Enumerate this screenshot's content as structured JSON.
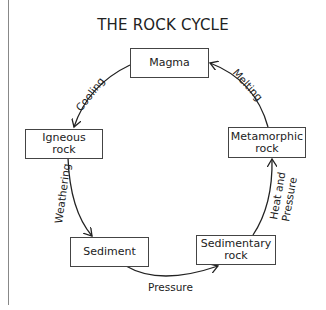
{
  "diagram": {
    "title": "THE ROCK CYCLE",
    "nodes": [
      {
        "id": "magma",
        "lines": [
          "Magma"
        ]
      },
      {
        "id": "igneous",
        "lines": [
          "Igneous",
          "rock"
        ]
      },
      {
        "id": "metamorphic",
        "lines": [
          "Metamorphic",
          "rock"
        ]
      },
      {
        "id": "sediment",
        "lines": [
          "Sediment"
        ]
      },
      {
        "id": "sedimentary",
        "lines": [
          "Sedimentary",
          "rock"
        ]
      }
    ],
    "edges": [
      {
        "from": "magma",
        "to": "igneous",
        "label": "Cooling"
      },
      {
        "from": "igneous",
        "to": "sediment",
        "label": "Weathering"
      },
      {
        "from": "sediment",
        "to": "sedimentary",
        "label": "Pressure"
      },
      {
        "from": "sedimentary",
        "to": "metamorphic",
        "label_lines": [
          "Heat and",
          "Pressure"
        ]
      },
      {
        "from": "metamorphic",
        "to": "magma",
        "label": "Melting"
      }
    ]
  }
}
